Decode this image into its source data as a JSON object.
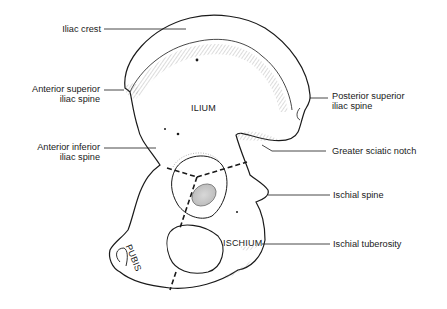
{
  "figure": {
    "regions": [
      {
        "id": "ilium",
        "label": "ILIUM"
      },
      {
        "id": "ischium",
        "label": "ISCHIUM"
      },
      {
        "id": "pubis",
        "label": "PUBIS"
      }
    ],
    "left_labels": [
      {
        "id": "iliac-crest",
        "line1": "Iliac crest",
        "line2": ""
      },
      {
        "id": "anterior-superior-iliac-spine",
        "line1": "Anterior superior",
        "line2": "iliac spine"
      },
      {
        "id": "anterior-inferior-iliac-spine",
        "line1": "Anterior inferior",
        "line2": "iliac spine"
      }
    ],
    "right_labels": [
      {
        "id": "posterior-superior-iliac-spine",
        "line1": "Posterior superior",
        "line2": "iliac spine"
      },
      {
        "id": "greater-sciatic-notch",
        "line1": "Greater sciatic notch",
        "line2": ""
      },
      {
        "id": "ischial-spine",
        "line1": "Ischial spine",
        "line2": ""
      },
      {
        "id": "ischial-tuberosity",
        "line1": "Ischial tuberosity",
        "line2": ""
      }
    ],
    "colors": {
      "line": "#1a1a1a",
      "shade": "#9a9a9a",
      "background": "#ffffff"
    }
  }
}
